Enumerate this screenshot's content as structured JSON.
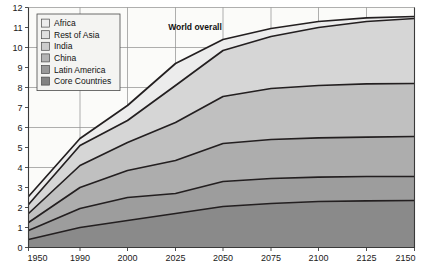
{
  "chart_data": {
    "type": "area",
    "stacked": true,
    "title": "",
    "subtitle": "",
    "xlabel": "",
    "ylabel": "",
    "x": [
      1950,
      1990,
      2000,
      2025,
      2050,
      2075,
      2100,
      2125,
      2150
    ],
    "xtick_labels": [
      "1950",
      "1990",
      "2000",
      "2025",
      "2050",
      "2075",
      "2100",
      "2125",
      "2150"
    ],
    "ytick_labels": [
      "0",
      "1",
      "2",
      "3",
      "4",
      "5",
      "6",
      "7",
      "8",
      "9",
      "10",
      "11",
      "12"
    ],
    "ylim": [
      0,
      12
    ],
    "xlim": [
      1950,
      2150
    ],
    "grid": true,
    "legend_position": "top-left",
    "annotations": [
      {
        "text": "World overall",
        "x": 2010,
        "y": 10.1
      }
    ],
    "series": [
      {
        "name": "Core Countries",
        "color": "#8a8a8a",
        "values": [
          0.4,
          1.0,
          1.35,
          1.7,
          2.05,
          2.2,
          2.3,
          2.33,
          2.35
        ]
      },
      {
        "name": "Latin America",
        "color": "#9d9d9d",
        "values": [
          0.85,
          1.95,
          2.5,
          2.7,
          3.3,
          3.45,
          3.52,
          3.55,
          3.55
        ]
      },
      {
        "name": "China",
        "color": "#adadad",
        "values": [
          1.25,
          3.0,
          3.85,
          4.35,
          5.2,
          5.4,
          5.48,
          5.52,
          5.55
        ]
      },
      {
        "name": "India",
        "color": "#c0c0c0",
        "values": [
          1.7,
          4.1,
          5.25,
          6.25,
          7.55,
          7.95,
          8.1,
          8.18,
          8.2
        ]
      },
      {
        "name": "Rest of Asia",
        "color": "#d6d6d6",
        "values": [
          2.15,
          5.1,
          6.35,
          8.1,
          9.85,
          10.55,
          11.0,
          11.3,
          11.45
        ]
      },
      {
        "name": "Africa",
        "color": "#ececec",
        "values": [
          2.55,
          5.45,
          7.1,
          9.2,
          10.4,
          10.95,
          11.3,
          11.48,
          11.55
        ]
      }
    ],
    "legend": [
      {
        "label": "Africa",
        "color": "#ececec"
      },
      {
        "label": "Rest of Asia",
        "color": "#e0e0e0"
      },
      {
        "label": "India",
        "color": "#cccccc"
      },
      {
        "label": "China",
        "color": "#b4b4b4"
      },
      {
        "label": "Latin America",
        "color": "#999999"
      },
      {
        "label": "Core Countries",
        "color": "#838383"
      }
    ]
  }
}
